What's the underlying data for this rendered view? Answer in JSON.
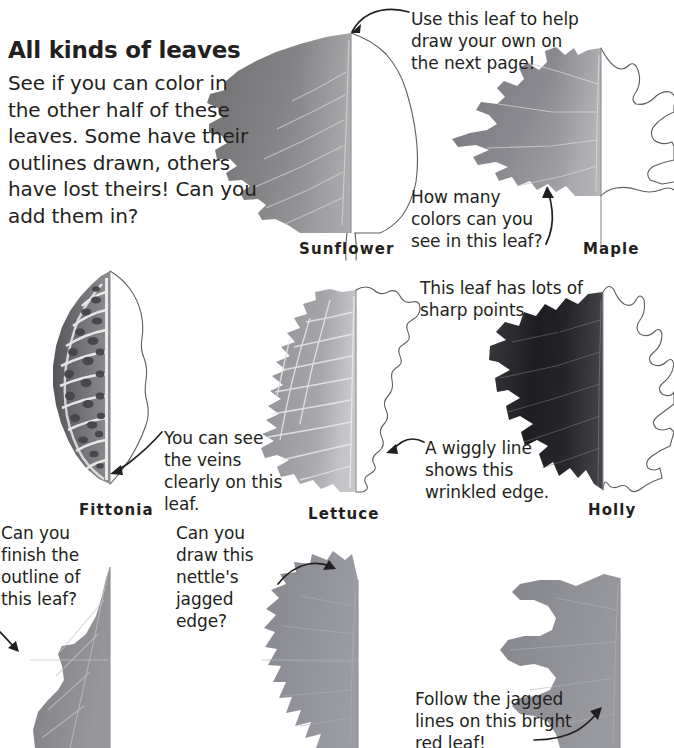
{
  "page": {
    "title": "All kinds of leaves",
    "intro": "See if you can color in the other half of these leaves. Some have their outlines drawn, others have lost theirs! Can you add them in?",
    "background_color": "#ffffff",
    "text_color": "#231f20",
    "outline_color": "#5d5d60"
  },
  "leaves": [
    {
      "id": "sunflower",
      "label": "Sunflower",
      "row": 1,
      "has_outline_half": true,
      "description": "heart-shaped leaf with central midrib, photo on left half, drawn outline on right half"
    },
    {
      "id": "maple",
      "label": "Maple",
      "row": 1,
      "has_outline_half": true,
      "description": "lobed maple leaf, photo on left half, drawn outline on right half running off page edge"
    },
    {
      "id": "fittonia",
      "label": "Fittonia",
      "row": 2,
      "has_outline_half": true,
      "description": "oval leaf with bold mosaic vein network, photo on left half, outline on right half"
    },
    {
      "id": "lettuce",
      "label": "Lettuce",
      "row": 2,
      "has_outline_half": true,
      "description": "crinkly lettuce leaf with cell-like veins, photo on left half, wiggly outline on right half"
    },
    {
      "id": "holly",
      "label": "Holly",
      "row": 2,
      "has_outline_half": true,
      "description": "dark spiky holly leaf, photo on left half, spiny outline on right half"
    },
    {
      "id": "bottom-left-leaf",
      "label": "",
      "row": 3,
      "has_outline_half": false,
      "description": "leaf photo half with no outline drawn, cropped at bottom of page"
    },
    {
      "id": "nettle",
      "label": "",
      "row": 3,
      "has_outline_half": false,
      "description": "nettle leaf half with jagged sawtooth edge, no outline drawn"
    },
    {
      "id": "red-oak",
      "label": "",
      "row": 3,
      "has_outline_half": false,
      "description": "bright red oak leaf half with deep jagged lobes, no outline drawn"
    }
  ],
  "annotations": [
    {
      "id": "sunflower-note",
      "text": "Use this leaf to help draw your own on the next page!",
      "points_to": "sunflower"
    },
    {
      "id": "maple-note",
      "text": "How many colors can you see in this leaf?",
      "points_to": "maple"
    },
    {
      "id": "fittonia-note",
      "text": "You can see the veins clearly on this leaf.",
      "points_to": "fittonia"
    },
    {
      "id": "holly-note",
      "text": "This leaf has lots of sharp points.",
      "points_to": "holly"
    },
    {
      "id": "lettuce-note",
      "text": "A wiggly line shows this wrinkled edge.",
      "points_to": "lettuce"
    },
    {
      "id": "bottom-left-note",
      "text": "Can you finish the outline of this leaf?",
      "points_to": "bottom-left-leaf"
    },
    {
      "id": "nettle-note",
      "text": "Can you draw this nettle's jagged edge?",
      "points_to": "nettle"
    },
    {
      "id": "red-oak-note",
      "text": "Follow the jagged lines on this bright red leaf!",
      "points_to": "red-oak"
    }
  ]
}
